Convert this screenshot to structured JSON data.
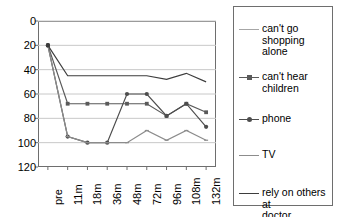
{
  "chart_data": {
    "type": "line",
    "title": "",
    "xlabel": "",
    "ylabel": "",
    "categories": [
      "pre",
      "11m",
      "18m",
      "36m",
      "48m",
      "72m",
      "96m",
      "108m",
      "132m"
    ],
    "ylim": [
      0,
      120
    ],
    "yticks": [
      0,
      20,
      40,
      60,
      80,
      100,
      120
    ],
    "grid": true,
    "legend_position": "right",
    "series": [
      {
        "name": "can't go shopping alone",
        "color": "#a6a6a6",
        "marker": "none",
        "values": [
          100,
          null,
          null,
          null,
          null,
          null,
          null,
          null,
          null
        ]
      },
      {
        "name": "can't hear children",
        "color": "#5a5a5a",
        "marker": "square",
        "values": [
          100,
          52,
          52,
          52,
          52,
          52,
          42,
          52,
          45
        ]
      },
      {
        "name": "phone",
        "color": "#4d4d4d",
        "marker": "dot",
        "values": [
          100,
          25,
          20,
          20,
          60,
          60,
          42,
          52,
          33
        ]
      },
      {
        "name": "TV",
        "color": "#8c8c8c",
        "marker": "tick",
        "values": [
          100,
          25,
          20,
          20,
          20,
          30,
          22,
          30,
          22
        ]
      },
      {
        "name": "rely on others at doctor",
        "color": "#3d3d3d",
        "marker": "none",
        "values": [
          100,
          75,
          75,
          75,
          75,
          75,
          72,
          77,
          70
        ]
      }
    ]
  },
  "axis": {
    "y_tick_labels": [
      "120",
      "100",
      "80",
      "60",
      "40",
      "20",
      "0"
    ],
    "x_tick_labels": [
      "pre",
      "11m",
      "18m",
      "36m",
      "48m",
      "72m",
      "96m",
      "108m",
      "132m"
    ]
  },
  "legend": {
    "entries": [
      {
        "label_line1": "can't go",
        "label_line2": "shopping alone"
      },
      {
        "label_line1": "can't hear",
        "label_line2": "children"
      },
      {
        "label_line1": "phone",
        "label_line2": ""
      },
      {
        "label_line1": "TV",
        "label_line2": ""
      },
      {
        "label_line1": "rely on others at",
        "label_line2": "doctor"
      }
    ]
  },
  "colors": {
    "grid": "#c8c8c8",
    "frame": "#6e6e6e",
    "background": "#ffffff"
  }
}
